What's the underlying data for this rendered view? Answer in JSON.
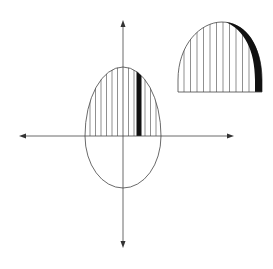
{
  "figure": {
    "caption": "",
    "y_axis_label": "",
    "colors": {
      "stroke": "#333333",
      "highlight": "#111111",
      "background": "#ffffff"
    },
    "main_strip_count": 13,
    "highlighted_strip_index": 9,
    "inset_strip_count": 12
  }
}
